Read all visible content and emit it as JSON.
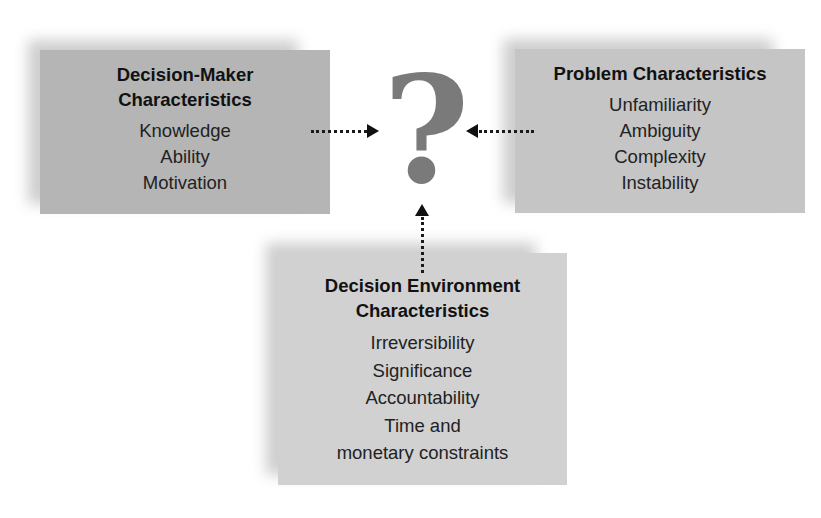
{
  "diagram": {
    "center": {
      "symbol": "?",
      "color": "#7a7a7a"
    },
    "boxes": {
      "decision_maker": {
        "title_line1": "Decision-Maker",
        "title_line2": "Characteristics",
        "items": [
          "Knowledge",
          "Ability",
          "Motivation"
        ],
        "fill": "#b5b5b5"
      },
      "problem": {
        "title_line1": "Problem Characteristics",
        "items": [
          "Unfamiliarity",
          "Ambiguity",
          "Complexity",
          "Instability"
        ],
        "fill": "#c5c5c5"
      },
      "environment": {
        "title_line1": "Decision Environment",
        "title_line2": "Characteristics",
        "items": [
          "Irreversibility",
          "Significance",
          "Accountability",
          "Time and",
          "monetary constraints"
        ],
        "fill": "#d1d1d1"
      }
    },
    "arrows": [
      {
        "from": "decision_maker",
        "to": "center",
        "style": "dotted"
      },
      {
        "from": "problem",
        "to": "center",
        "style": "dotted"
      },
      {
        "from": "environment",
        "to": "center",
        "style": "dotted"
      }
    ]
  }
}
